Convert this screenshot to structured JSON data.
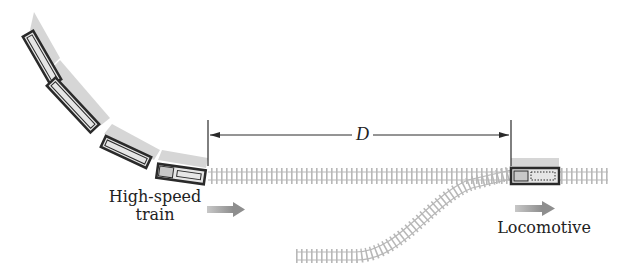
{
  "diagram": {
    "labels": {
      "distance": "D",
      "train_line1": "High-speed",
      "train_line2": "train",
      "locomotive": "Locomotive"
    },
    "colors": {
      "track": "#b8b8b8",
      "shadow": "#d6d6d6",
      "car_outline": "#2a2a2a",
      "arrow": "#a0a0a0"
    }
  }
}
